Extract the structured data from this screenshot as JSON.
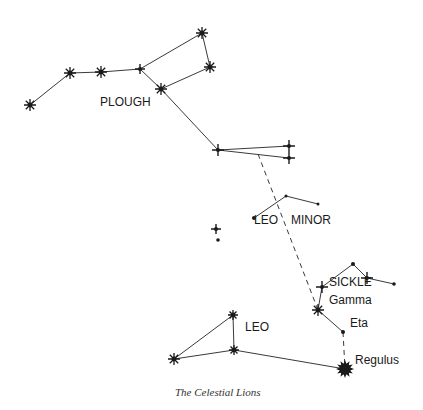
{
  "diagram": {
    "title": "The Celestial Lions",
    "colors": {
      "ink": "#1a1a1a",
      "line": "#3a3a3a",
      "background": "#ffffff"
    },
    "labels": [
      {
        "id": "plough",
        "text": "PLOUGH",
        "x": 100,
        "y": 106
      },
      {
        "id": "leo-minor-1",
        "text": "LEO",
        "x": 254,
        "y": 224
      },
      {
        "id": "leo-minor-2",
        "text": "MINOR",
        "x": 291,
        "y": 224
      },
      {
        "id": "sickle",
        "text": "SICKLE",
        "x": 329,
        "y": 286
      },
      {
        "id": "gamma",
        "text": "Gamma",
        "x": 329,
        "y": 304
      },
      {
        "id": "eta",
        "text": "Eta",
        "x": 350,
        "y": 327
      },
      {
        "id": "leo",
        "text": "LEO",
        "x": 245,
        "y": 331
      },
      {
        "id": "regulus",
        "text": "Regulus",
        "x": 355,
        "y": 364
      }
    ],
    "stars": [
      {
        "id": "p1",
        "x": 30,
        "y": 105,
        "type": "burst",
        "size": 6
      },
      {
        "id": "p2",
        "x": 70,
        "y": 73,
        "type": "burst",
        "size": 6
      },
      {
        "id": "p3",
        "x": 101,
        "y": 72,
        "type": "burst",
        "size": 6
      },
      {
        "id": "p4",
        "x": 140,
        "y": 69,
        "type": "cross",
        "size": 5
      },
      {
        "id": "p5",
        "x": 202,
        "y": 33,
        "type": "burst",
        "size": 6
      },
      {
        "id": "p6",
        "x": 210,
        "y": 67,
        "type": "burst",
        "size": 6
      },
      {
        "id": "p7",
        "x": 161,
        "y": 89,
        "type": "burst",
        "size": 6
      },
      {
        "id": "p8",
        "x": 218,
        "y": 150,
        "type": "cross",
        "size": 6
      },
      {
        "id": "p9",
        "x": 289,
        "y": 146,
        "type": "cross",
        "size": 6
      },
      {
        "id": "p10",
        "x": 289,
        "y": 158,
        "type": "cross",
        "size": 6
      },
      {
        "id": "lm1",
        "x": 254,
        "y": 218,
        "type": "dot",
        "size": 2
      },
      {
        "id": "lm2",
        "x": 286,
        "y": 196,
        "type": "dot",
        "size": 1.5
      },
      {
        "id": "lm3",
        "x": 318,
        "y": 204,
        "type": "dot",
        "size": 1.5
      },
      {
        "id": "lone1",
        "x": 216,
        "y": 229,
        "type": "cross",
        "size": 5
      },
      {
        "id": "lone2",
        "x": 218,
        "y": 240,
        "type": "dot",
        "size": 1.8
      },
      {
        "id": "s-top",
        "x": 353,
        "y": 264,
        "type": "dot",
        "size": 2
      },
      {
        "id": "s-mid",
        "x": 367,
        "y": 278,
        "type": "cross",
        "size": 6
      },
      {
        "id": "s-end",
        "x": 394,
        "y": 284,
        "type": "dot",
        "size": 1.8
      },
      {
        "id": "s-upper",
        "x": 322,
        "y": 287,
        "type": "cross",
        "size": 6
      },
      {
        "id": "gamma",
        "x": 318,
        "y": 310,
        "type": "burst",
        "size": 6
      },
      {
        "id": "eta",
        "x": 343,
        "y": 332,
        "type": "dot",
        "size": 2
      },
      {
        "id": "regulus",
        "x": 345,
        "y": 369,
        "type": "big",
        "size": 9
      },
      {
        "id": "leo-a",
        "x": 233,
        "y": 315,
        "type": "burst",
        "size": 5
      },
      {
        "id": "leo-b",
        "x": 234,
        "y": 350,
        "type": "burst",
        "size": 5
      },
      {
        "id": "leo-c",
        "x": 174,
        "y": 359,
        "type": "burst",
        "size": 6
      }
    ],
    "lines": [
      [
        "p1",
        "p2"
      ],
      [
        "p2",
        "p3"
      ],
      [
        "p3",
        "p4"
      ],
      [
        "p4",
        "p5"
      ],
      [
        "p5",
        "p6"
      ],
      [
        "p6",
        "p7"
      ],
      [
        "p4",
        "p7"
      ],
      [
        "p7",
        "p8"
      ],
      [
        "p8",
        "p9"
      ],
      [
        "p8",
        "p10"
      ],
      [
        "lm1",
        "lm2"
      ],
      [
        "lm2",
        "lm3"
      ],
      [
        "s-upper",
        "s-top"
      ],
      [
        "s-top",
        "s-mid"
      ],
      [
        "s-mid",
        "s-end"
      ],
      [
        "s-upper",
        "gamma"
      ],
      [
        "gamma",
        "eta"
      ],
      [
        "leo-c",
        "leo-a"
      ],
      [
        "leo-a",
        "leo-b"
      ],
      [
        "leo-c",
        "leo-b"
      ],
      [
        "leo-b",
        "regulus"
      ]
    ],
    "dashed_lines": [
      {
        "from": {
          "x": 258,
          "y": 154
        },
        "to": {
          "x": 318,
          "y": 310
        }
      },
      {
        "from": {
          "x": 343,
          "y": 332
        },
        "to": {
          "x": 345,
          "y": 369
        }
      }
    ]
  },
  "caption": {
    "text": "The Celestial Lions",
    "x": 175,
    "y": 387
  }
}
